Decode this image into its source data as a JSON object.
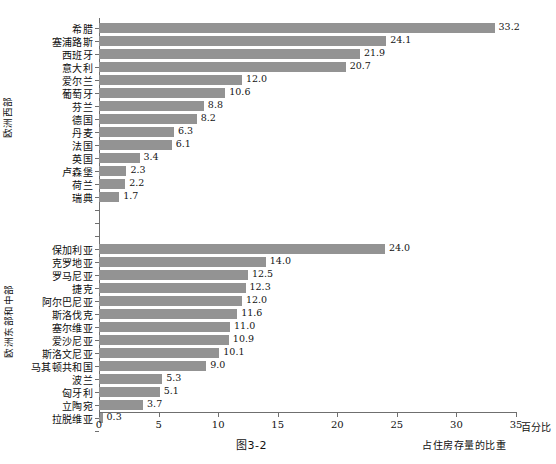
{
  "figure": {
    "caption": "图3-2",
    "x_axis_title": "占住房存量的比重",
    "x_axis_unit": "百分比",
    "top_fragment": "",
    "bar_color": "#939393",
    "axis_color": "#6f6f6f"
  },
  "chart_data": {
    "type": "bar",
    "orientation": "horizontal",
    "title": "",
    "xlabel": "占住房存量的比重",
    "ylabel": "",
    "xlim": [
      0,
      35
    ],
    "xticks": [
      0,
      5,
      10,
      15,
      20,
      25,
      30,
      35
    ],
    "xtick_labels": [
      "0",
      "5",
      "10",
      "15",
      "20",
      "25",
      "30",
      "35"
    ],
    "unit": "百分比",
    "grid": false,
    "legend": "none",
    "groups": [
      {
        "name": "欧洲西部",
        "categories": [
          "希腊",
          "塞浦路斯",
          "西班牙",
          "意大利",
          "爱尔兰",
          "葡萄牙",
          "芬兰",
          "德国",
          "丹麦",
          "法国",
          "英国",
          "卢森堡",
          "荷兰",
          "瑞典"
        ],
        "values": [
          33.2,
          24.1,
          21.9,
          20.7,
          12.0,
          10.6,
          8.8,
          8.2,
          6.3,
          6.1,
          3.4,
          2.3,
          2.2,
          1.7
        ],
        "labels": [
          "33.2",
          "24.1",
          "21.9",
          "20.7",
          "12.0",
          "10.6",
          "8.8",
          "8.2",
          "6.3",
          "6.1",
          "3.4",
          "2.3",
          "2.2",
          "1.7"
        ]
      },
      {
        "name": "欧洲东部和中部",
        "categories": [
          "保加利亚",
          "克罗地亚",
          "罗马尼亚",
          "捷克",
          "阿尔巴尼亚",
          "斯洛伐克",
          "塞尔维亚",
          "爱沙尼亚",
          "斯洛文尼亚",
          "马其顿共和国",
          "波兰",
          "匈牙利",
          "立陶宛",
          "拉脱维亚"
        ],
        "values": [
          24.0,
          14.0,
          12.5,
          12.3,
          12.0,
          11.6,
          11.0,
          10.9,
          10.1,
          9.0,
          5.3,
          5.1,
          3.7,
          0.3
        ],
        "labels": [
          "24.0",
          "14.0",
          "12.5",
          "12.3",
          "12.0",
          "11.6",
          "11.0",
          "10.9",
          "10.1",
          "9.0",
          "5.3",
          "5.1",
          "3.7",
          "0.3"
        ]
      }
    ]
  }
}
